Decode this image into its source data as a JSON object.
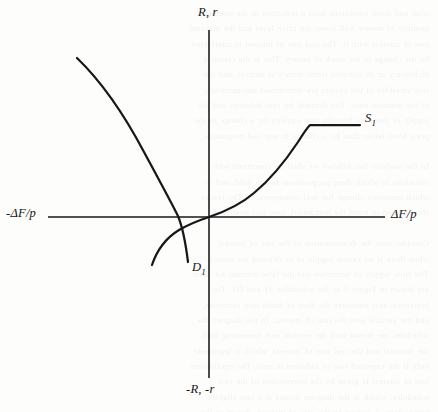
{
  "figure": {
    "name": "supply-demand-loanable-funds-diagram",
    "background_color": "#fdfdfb",
    "ink_color": "#17171a",
    "axes": {
      "vertical_top_label": "R, r",
      "vertical_bottom_label": "-R, -r",
      "horizontal_right_label": "ΔF/p",
      "horizontal_left_label": "-ΔF/p",
      "origin_px": [
        209,
        217
      ],
      "x_range_px": [
        48,
        385
      ],
      "y_range_px": [
        30,
        378
      ]
    },
    "curves": [
      {
        "label": "S",
        "label_subscript": "1",
        "role": "supply-curve",
        "direction": "upward-sloping",
        "description": "rises through the origin, steepens, then kinks into a horizontal ceiling on the right",
        "label_px": [
          365,
          111
        ]
      },
      {
        "label": "D",
        "label_subscript": "1",
        "role": "demand-curve",
        "direction": "downward-sloping",
        "description": "falls from upper left, convex, crosses the horizontal axis left of the origin",
        "label_px": [
          192,
          260
        ]
      }
    ],
    "ghost_text": "wise and these conditions hold a reduction in the nominal\nquantity of money will lower the price level and the nominal\nrate of interest with it. The real rate of interest is unaffected\nby the change in the stock of money. This is the classical\ndichotomy in its sharpest form: money is neutral, and the\nreal variables of the system are determined independently\nof the nominal ones. The demand for real balances and the\nsupply of them are brought into equality by a change in the\nprice level rather than by a change in any real magnitude.\n\nIn the analysis that follows we shall be concerned with\nsituations in which these propositions fail to hold, and in\nwhich monetary change has real consequences. The reader\nshould keep in mind the benchmark case just described.\n\nConsider now the determination of the rate of interest\nwhen there is an excess supply of or demand for money.\nThe flow supply of securities and the flow demand for them\nare drawn in Figure 1 as the schedules S1 and D1. The\nhorizontal axis measures the flow of funds into securities,\nand the vertical axis the rate of interest. In the diagram the\nschedules are drawn with the vertical axis measuring both\nthe nominal and the real rate of interest, which is legitimate\nonly if the expected rate of inflation is zero. The equilibrium\nrate of interest is given by the intersection of the two\nschedules, which in the diagram occurs at a rate slightly\nbelow zero. A ceiling on the rate of interest, shown as the\nflat portion of the S1 schedule, prevents the rate from rising\nfurther; the quantity of funds is then rationed among the\ncompeting borrowers by some non-price mechanism."
  }
}
